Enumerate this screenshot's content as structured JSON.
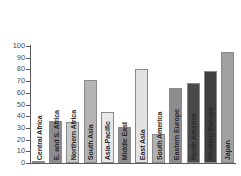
{
  "chart_data": {
    "type": "bar",
    "title": "",
    "xlabel": "",
    "ylabel": "",
    "ylim": [
      0,
      100
    ],
    "yticks": [
      0,
      10,
      20,
      30,
      40,
      50,
      60,
      70,
      80,
      90,
      100
    ],
    "grid": false,
    "legend": "none",
    "orientation": "vertical",
    "categories": [
      "Central Africa",
      "E. and S. Africa",
      "Northern Africa",
      "South Asia",
      "Asia-Pacific",
      "Middle East",
      "East Asia",
      "South America",
      "Eastern Europe",
      "North America",
      "Western Europe",
      "Japan"
    ],
    "values": [
      1,
      36,
      35,
      71,
      44,
      31,
      80,
      25,
      64,
      68,
      79,
      95
    ],
    "bar_colors": [
      "#b0b0b0",
      "#8d8d8f",
      "#c8c8c8",
      "#b4b4b4",
      "#e8e8e8",
      "#8d8d8f",
      "#e2e2e2",
      "#b0b0b0",
      "#8d8d8f",
      "#4a4a4c",
      "#3f3f41",
      "#a0a0a2"
    ]
  },
  "axis": {
    "tick_color": "#59595b",
    "label_color": "#4d4d4f"
  }
}
